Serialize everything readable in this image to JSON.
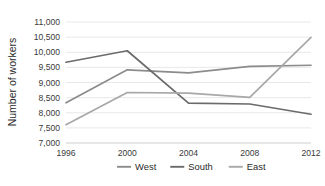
{
  "chart_data": {
    "type": "line",
    "title": "",
    "xlabel": "",
    "ylabel": "Number of workers",
    "categories": [
      "1996",
      "2000",
      "2004",
      "2008",
      "2012"
    ],
    "x": [
      1996,
      2000,
      2004,
      2008,
      2012
    ],
    "ylim": [
      7000,
      11000
    ],
    "ytick_step": 500,
    "ytick_labels": [
      "7,000",
      "7,500",
      "8,000",
      "8,500",
      "9,000",
      "9,500",
      "10,000",
      "10,500",
      "11,000"
    ],
    "ytick_values": [
      7000,
      7500,
      8000,
      8500,
      9000,
      9500,
      10000,
      10500,
      11000
    ],
    "grid": true,
    "grid_axis": "y",
    "legend_position": "bottom",
    "series": [
      {
        "name": "West",
        "color": "#8c8c8c",
        "values": [
          8330,
          9420,
          9320,
          9530,
          9570
        ]
      },
      {
        "name": "South",
        "color": "#6b6b6b",
        "values": [
          9670,
          10050,
          8320,
          8290,
          7950
        ]
      },
      {
        "name": "East",
        "color": "#a8a8a8",
        "values": [
          7600,
          8670,
          8650,
          8510,
          10490
        ]
      }
    ]
  },
  "axis": {
    "y_title": "Number of workers"
  },
  "legend": {
    "items": [
      {
        "label": "West",
        "color": "#8c8c8c"
      },
      {
        "label": "South",
        "color": "#6b6b6b"
      },
      {
        "label": "East",
        "color": "#a8a8a8"
      }
    ]
  },
  "colors": {
    "grid": "#e2e2e2",
    "axis": "#c9c9c9",
    "text": "#2b2b2b",
    "background": "#ffffff"
  }
}
